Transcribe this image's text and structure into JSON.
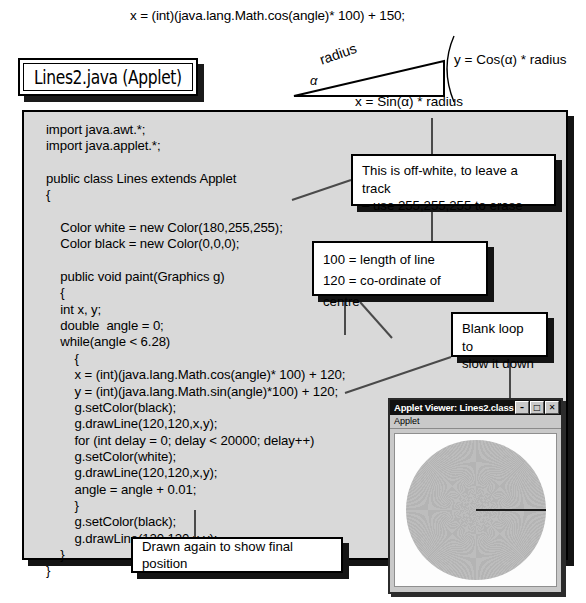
{
  "top_formula": "x = (int)(java.lang.Math.cos(angle)* 100) + 150;",
  "diagram": {
    "radius_label": "radius",
    "alpha_label": "α",
    "y_label": "y = Cos(α) * radius",
    "x_label": "x = Sin(α) * radius"
  },
  "title_plaque": {
    "text": "Lines2.java (Applet)"
  },
  "code": {
    "lines": [
      "import java.awt.*;",
      "import java.applet.*;",
      "",
      "public class Lines extends Applet",
      "{",
      "",
      "    Color white = new Color(180,255,255);",
      "    Color black = new Color(0,0,0);",
      "",
      "    public void paint(Graphics g)",
      "    {",
      "    int x, y;",
      "    double  angle = 0;",
      "    while(angle < 6.28)",
      "        {",
      "        x = (int)(java.lang.Math.cos(angle)* 100) + 120;",
      "        y = (int)(java.lang.Math.sin(angle)*100) + 120;",
      "        g.setColor(black);",
      "        g.drawLine(120,120,x,y);",
      "        for (int delay = 0; delay < 20000; delay++)",
      "        g.setColor(white);",
      "        g.drawLine(120,120,x,y);",
      "        angle = angle + 0.01;",
      "        }",
      "        g.setColor(black);",
      "        g.drawLine(120,120,x,y);",
      "    }",
      "}"
    ]
  },
  "callouts": {
    "offwhite": "This is off-white, to leave a track\n– use 255,255,255 to erase",
    "params": "100 = length of line\n120 = co-ordinate of centre",
    "blank_loop": "Blank loop to\nslow it down",
    "drawn_again": "Drawn again to show final position"
  },
  "applet_window": {
    "title": "Applet Viewer: Lines2.class",
    "minimize_glyph": "–",
    "maximize_glyph": "□",
    "close_glyph": "✕",
    "menu_label": "Applet"
  },
  "colors": {
    "code_panel_bg": "#d9d9d9",
    "shadow": "#141414",
    "applet_chrome": "#c9c9c9",
    "circle_fill": "#b8b8b8",
    "radius_line": "#1b1b1b"
  }
}
